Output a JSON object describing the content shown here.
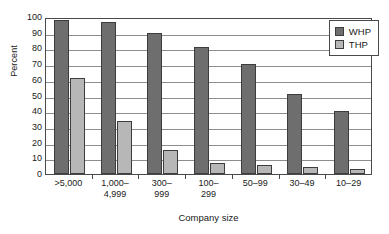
{
  "chart_data": {
    "type": "bar",
    "title": "",
    "xlabel": "Company size",
    "ylabel": "Percent",
    "ylim": [
      0,
      100
    ],
    "ytick_step": 10,
    "yticks": [
      100,
      90,
      80,
      70,
      60,
      50,
      40,
      30,
      20,
      10,
      0
    ],
    "grid": true,
    "legend_position": "top-right",
    "categories": [
      ">5,000",
      "1,000–4,999",
      "300–999",
      "100–299",
      "50–99",
      "30–49",
      "10–29"
    ],
    "category_lines": [
      {
        "l1": ">5,000",
        "l2": ""
      },
      {
        "l1": "1,000–",
        "l2": "4,999"
      },
      {
        "l1": "300–",
        "l2": "999"
      },
      {
        "l1": "100–",
        "l2": "299"
      },
      {
        "l1": "50–99",
        "l2": ""
      },
      {
        "l1": "30–49",
        "l2": ""
      },
      {
        "l1": "10–29",
        "l2": ""
      }
    ],
    "series": [
      {
        "name": "WHP",
        "color": "#6e6e6e",
        "values": [
          98,
          97,
          90,
          81,
          70,
          51,
          40
        ]
      },
      {
        "name": "THP",
        "color": "#b7b7b7",
        "values": [
          61,
          34,
          15.5,
          7,
          5.5,
          4.5,
          3.5
        ]
      }
    ]
  },
  "legend": {
    "items": [
      {
        "label": "WHP",
        "color": "#6e6e6e"
      },
      {
        "label": "THP",
        "color": "#b7b7b7"
      }
    ]
  }
}
